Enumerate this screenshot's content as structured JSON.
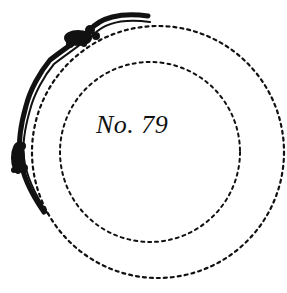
{
  "figure": {
    "label": "No. 79",
    "ink_color": "#111111",
    "background": "#ffffff",
    "elements": [
      "outer dotted circle",
      "inner dotted circle",
      "curved wavy band with foliage clusters along upper-left arc"
    ]
  }
}
